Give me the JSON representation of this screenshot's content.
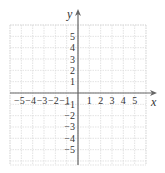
{
  "diagram": {
    "type": "coordinate-plane",
    "axes": {
      "x_label": "x",
      "y_label": "y",
      "x_ticks": [
        -5,
        -4,
        -3,
        -2,
        -1,
        1,
        2,
        3,
        4,
        5
      ],
      "y_ticks": [
        5,
        4,
        3,
        2,
        1,
        -1,
        -2,
        -3,
        -4,
        -5
      ],
      "x_range": [
        -6,
        6
      ],
      "y_range": [
        -6,
        6
      ]
    },
    "grid": {
      "visible": true,
      "line_color": "#dcdcdc",
      "style": "dotted"
    },
    "axis_color": "#555555"
  },
  "labels": {
    "x_ticks": [
      "−5",
      "−4",
      "−3",
      "−2",
      "−1",
      "1",
      "2",
      "3",
      "4",
      "5"
    ],
    "y_ticks": [
      "5",
      "4",
      "3",
      "2",
      "1",
      "−1",
      "−2",
      "−3",
      "−4",
      "−5"
    ],
    "x_axis": "x",
    "y_axis": "y"
  }
}
